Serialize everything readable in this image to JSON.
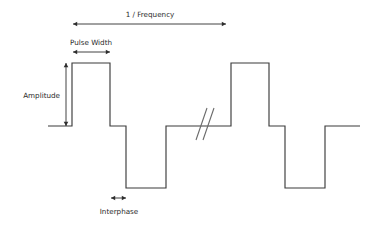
{
  "figure": {
    "background_color": "#ffffff",
    "trace_color": "#3b3b3b",
    "annotation_color": "#2e2e2e",
    "break_color": "#6a6a6a"
  },
  "labels": {
    "frequency": "1 / Frequency",
    "pulse_width": "Pulse Width",
    "amplitude": "Amplitude",
    "interphase": "Interphase"
  },
  "chart_data": {
    "type": "line",
    "xlabel": "",
    "ylabel": "",
    "grid": false,
    "legend": false,
    "axis_levels": {
      "positive_plateau_y": 63,
      "baseline_y": 126,
      "negative_trough_y": 188
    },
    "series": [
      {
        "name": "stimulation-waveform",
        "points": [
          [
            48,
            126
          ],
          [
            72,
            126
          ],
          [
            72,
            63
          ],
          [
            110,
            63
          ],
          [
            110,
            126
          ],
          [
            126,
            126
          ],
          [
            126,
            188
          ],
          [
            166,
            188
          ],
          [
            166,
            126
          ],
          [
            231,
            126
          ],
          [
            231,
            63
          ],
          [
            269,
            63
          ],
          [
            269,
            126
          ],
          [
            285,
            126
          ],
          [
            285,
            188
          ],
          [
            325,
            188
          ],
          [
            325,
            126
          ],
          [
            360,
            126
          ]
        ]
      }
    ],
    "break_marker": {
      "name": "axis-break-double-slash",
      "slashes": [
        [
          196,
          140,
          207,
          108
        ],
        [
          203,
          140,
          214,
          108
        ]
      ]
    },
    "annotations": [
      {
        "name": "frequency-dimension",
        "label": "1 / Frequency",
        "orientation": "horizontal",
        "x1": 73,
        "x2": 226,
        "y": 24,
        "label_x": 150,
        "label_y": 17
      },
      {
        "name": "pulse-width-dimension",
        "label": "Pulse Width",
        "orientation": "horizontal",
        "x1": 73,
        "x2": 110,
        "y": 52,
        "label_x": 91,
        "label_y": 45
      },
      {
        "name": "amplitude-dimension",
        "label": "Amplitude",
        "orientation": "vertical",
        "x": 66,
        "y1": 63,
        "y2": 126,
        "label_x": 60,
        "label_y": 98
      },
      {
        "name": "interphase-dimension",
        "label": "Interphase",
        "orientation": "horizontal",
        "x1": 111,
        "x2": 126,
        "y": 198,
        "label_x": 119,
        "label_y": 214
      }
    ]
  }
}
